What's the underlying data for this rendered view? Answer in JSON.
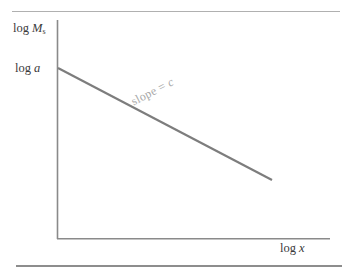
{
  "figure": {
    "background_color": "#ffffff",
    "line_color": "#7d7d7d",
    "axis_color": "#8a8a8a",
    "text_color": "#3a3a3a",
    "annotation_color": "#a8a8a8",
    "rule_top_color": "#b0b0b0",
    "rule_bottom_color": "#8d8d8d"
  },
  "labels": {
    "ylabel_prefix": "log ",
    "ylabel_symbol": "M",
    "ylabel_subscript": "s",
    "yintercept_prefix": "log ",
    "yintercept_symbol": "a",
    "xlabel_prefix": "log ",
    "xlabel_symbol": "x",
    "slope_text": "slope = ",
    "slope_symbol": "c"
  },
  "chart_data": {
    "type": "line",
    "title": "",
    "subtitle": "",
    "xlabel": "log x",
    "ylabel": "log Mₛ",
    "legend": [],
    "legend_position": "none",
    "grid": false,
    "axis_style": "open-corner",
    "xlim": [
      0,
      1
    ],
    "ylim": [
      0,
      1
    ],
    "xticks": [],
    "yticks": [
      "log a"
    ],
    "xtick_labels": [],
    "ytick_labels": [
      "log a"
    ],
    "annotations": [
      {
        "text": "slope = c",
        "rotation_deg": -27.3,
        "placement": "above-line-midpoint"
      }
    ],
    "series": [
      {
        "name": "log Mₛ vs log x",
        "kind": "straight-line",
        "description": "Decreasing straight line beginning at the y-intercept log a and descending to the right with constant negative slope c.",
        "intercept_label": "log a",
        "slope_label": "c",
        "slope_sign": "negative",
        "x": [
          0.0,
          1.0
        ],
        "y": [
          1.0,
          0.48
        ],
        "pixel_points": [
          [
            58,
            68
          ],
          [
            272,
            180
          ]
        ]
      }
    ]
  },
  "geometry": {
    "y_axis": {
      "x": 57,
      "y_top": 20,
      "y_bottom": 239
    },
    "x_axis": {
      "y": 239,
      "x_left": 57,
      "x_right": 330
    },
    "data_line": {
      "x1": 58,
      "y1": 68,
      "x2": 272,
      "y2": 180
    }
  }
}
